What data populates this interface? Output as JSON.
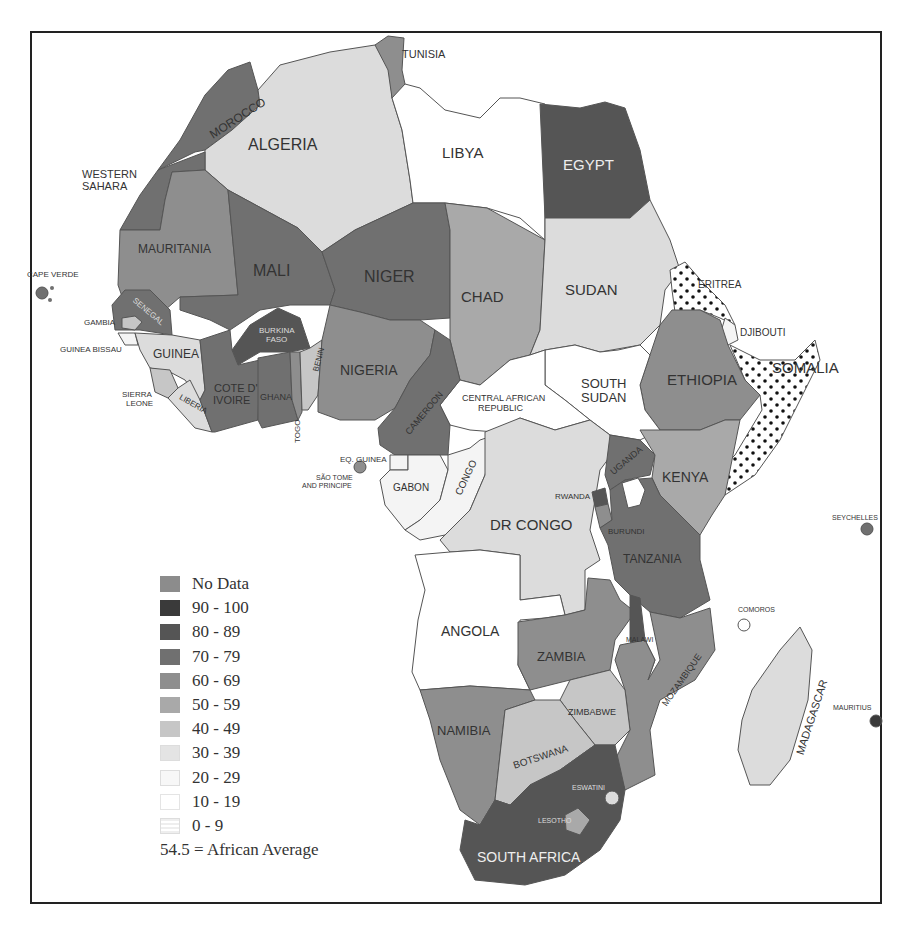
{
  "map": {
    "region": "Africa",
    "legend": {
      "items": [
        {
          "label": "No Data",
          "color": "#8c8c8c"
        },
        {
          "label": "90 - 100",
          "color": "#3a3a3a"
        },
        {
          "label": "80 - 89",
          "color": "#555555"
        },
        {
          "label": "70 - 79",
          "color": "#707070"
        },
        {
          "label": "60 - 69",
          "color": "#8e8e8e"
        },
        {
          "label": "50 - 59",
          "color": "#a9a9a9"
        },
        {
          "label": "40 - 49",
          "color": "#c6c6c6"
        },
        {
          "label": "30 - 39",
          "color": "#dcdcdc"
        },
        {
          "label": "20 - 29",
          "color": "#f4f4f4"
        },
        {
          "label": "10 - 19",
          "color": "#ffffff"
        },
        {
          "label": "0 - 9",
          "color": "dotted"
        }
      ],
      "average_note": "54.5 = African Average"
    },
    "countries": [
      {
        "name": "TUNISIA",
        "bin": "60 - 69"
      },
      {
        "name": "MOROCCO",
        "bin": "70 - 79"
      },
      {
        "name": "ALGERIA",
        "bin": "30 - 39"
      },
      {
        "name": "LIBYA",
        "bin": "10 - 19"
      },
      {
        "name": "EGYPT",
        "bin": "80 - 89"
      },
      {
        "name": "WESTERN SAHARA",
        "bin": "70 - 79"
      },
      {
        "name": "MAURITANIA",
        "bin": "60 - 69"
      },
      {
        "name": "MALI",
        "bin": "70 - 79"
      },
      {
        "name": "NIGER",
        "bin": "70 - 79"
      },
      {
        "name": "CHAD",
        "bin": "50 - 59"
      },
      {
        "name": "SUDAN",
        "bin": "30 - 39"
      },
      {
        "name": "ERITREA",
        "bin": "0 - 9"
      },
      {
        "name": "DJIBOUTI",
        "bin": "20 - 29"
      },
      {
        "name": "SOMALIA",
        "bin": "0 - 9"
      },
      {
        "name": "ETHIOPIA",
        "bin": "60 - 69"
      },
      {
        "name": "SOUTH SUDAN",
        "bin": "10 - 19"
      },
      {
        "name": "CENTRAL AFRICAN REPUBLIC",
        "bin": "10 - 19"
      },
      {
        "name": "CAPE VERDE",
        "bin": "70 - 79"
      },
      {
        "name": "SENEGAL",
        "bin": "70 - 79"
      },
      {
        "name": "GAMBIA",
        "bin": "40 - 49"
      },
      {
        "name": "GUINEA BISSAU",
        "bin": "20 - 29"
      },
      {
        "name": "GUINEA",
        "bin": "30 - 39"
      },
      {
        "name": "SIERRA LEONE",
        "bin": "40 - 49"
      },
      {
        "name": "LIBERIA",
        "bin": "30 - 39"
      },
      {
        "name": "BURKINA FASO",
        "bin": "80 - 89"
      },
      {
        "name": "COTE D' IVOIRE",
        "bin": "70 - 79"
      },
      {
        "name": "GHANA",
        "bin": "70 - 79"
      },
      {
        "name": "TOGO",
        "bin": "60 - 69"
      },
      {
        "name": "BENIN",
        "bin": "40 - 49"
      },
      {
        "name": "NIGERIA",
        "bin": "60 - 69"
      },
      {
        "name": "CAMEROON",
        "bin": "70 - 79"
      },
      {
        "name": "EQ. GUINEA",
        "bin": "20 - 29"
      },
      {
        "name": "SÃO TOME AND PRINCIPE",
        "bin": "60 - 69"
      },
      {
        "name": "GABON",
        "bin": "20 - 29"
      },
      {
        "name": "CONGO",
        "bin": "20 - 29"
      },
      {
        "name": "DR CONGO",
        "bin": "30 - 39"
      },
      {
        "name": "UGANDA",
        "bin": "70 - 79"
      },
      {
        "name": "KENYA",
        "bin": "50 - 59"
      },
      {
        "name": "RWANDA",
        "bin": "80 - 89"
      },
      {
        "name": "BURUNDI",
        "bin": "60 - 69"
      },
      {
        "name": "TANZANIA",
        "bin": "70 - 79"
      },
      {
        "name": "SEYCHELLES",
        "bin": "70 - 79"
      },
      {
        "name": "COMOROS",
        "bin": "10 - 19"
      },
      {
        "name": "ANGOLA",
        "bin": "10 - 19"
      },
      {
        "name": "ZAMBIA",
        "bin": "60 - 69"
      },
      {
        "name": "MALAWI",
        "bin": "80 - 89"
      },
      {
        "name": "MOZAMBIQUE",
        "bin": "60 - 69"
      },
      {
        "name": "MADAGASCAR",
        "bin": "30 - 39"
      },
      {
        "name": "MAURITIUS",
        "bin": "90 - 100"
      },
      {
        "name": "NAMIBIA",
        "bin": "60 - 69"
      },
      {
        "name": "BOTSWANA",
        "bin": "40 - 49"
      },
      {
        "name": "ZIMBABWE",
        "bin": "40 - 49"
      },
      {
        "name": "ESWATINI",
        "bin": "30 - 39"
      },
      {
        "name": "LESOTHO",
        "bin": "50 - 59"
      },
      {
        "name": "SOUTH AFRICA",
        "bin": "80 - 89"
      }
    ]
  },
  "labels": {
    "tunisia": "TUNISIA",
    "morocco": "MOROCCO",
    "algeria": "ALGERIA",
    "libya": "LIBYA",
    "egypt": "EGYPT",
    "western_sahara_1": "WESTERN",
    "western_sahara_2": "SAHARA",
    "mauritania": "MAURITANIA",
    "mali": "MALI",
    "niger": "NIGER",
    "chad": "CHAD",
    "sudan": "SUDAN",
    "eritrea": "ERITREA",
    "djibouti": "DJIBOUTI",
    "somalia": "SOMALIA",
    "ethiopia": "ETHIOPIA",
    "south_sudan_1": "SOUTH",
    "south_sudan_2": "SUDAN",
    "car_1": "CENTRAL AFRICAN",
    "car_2": "REPUBLIC",
    "cape_verde": "CAPE VERDE",
    "senegal": "SENEGAL",
    "gambia": "GAMBIA",
    "guinea_bissau": "GUINEA BISSAU",
    "guinea": "GUINEA",
    "sierra_leone_1": "SIERRA",
    "sierra_leone_2": "LEONE",
    "liberia": "LIBERIA",
    "burkina_1": "BURKINA",
    "burkina_2": "FASO",
    "cote_1": "COTE D'",
    "cote_2": "IVOIRE",
    "ghana": "GHANA",
    "togo": "TOGO",
    "benin": "BENIN",
    "nigeria": "NIGERIA",
    "cameroon": "CAMEROON",
    "eq_guinea": "EQ. GUINEA",
    "sao_tome_1": "SÃO TOME",
    "sao_tome_2": "AND PRINCIPE",
    "gabon": "GABON",
    "congo": "CONGO",
    "dr_congo": "DR CONGO",
    "uganda": "UGANDA",
    "kenya": "KENYA",
    "rwanda": "RWANDA",
    "burundi": "BURUNDI",
    "tanzania": "TANZANIA",
    "seychelles": "SEYCHELLES",
    "comoros": "COMOROS",
    "angola": "ANGOLA",
    "zambia": "ZAMBIA",
    "malawi": "MALAWI",
    "mozambique": "MOZAMBIQUE",
    "madagascar": "MADAGASCAR",
    "mauritius": "MAURITIUS",
    "namibia": "NAMIBIA",
    "botswana": "BOTSWANA",
    "zimbabwe": "ZIMBABWE",
    "eswatini": "ESWATINI",
    "lesotho": "LESOTHO",
    "south_africa": "SOUTH AFRICA"
  }
}
